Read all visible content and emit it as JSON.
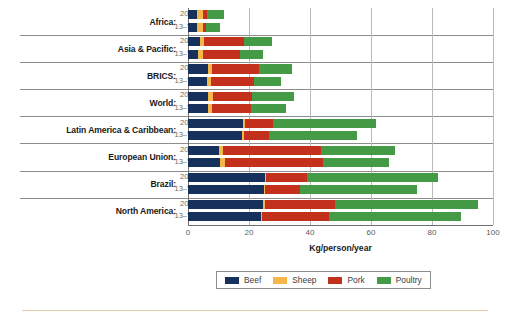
{
  "chart_data": {
    "type": "bar",
    "orientation": "horizontal",
    "stacked": true,
    "title": "",
    "xlabel": "Kg/person/year",
    "ylabel": "",
    "xlim": [
      0,
      100
    ],
    "xticks": [
      0,
      20,
      40,
      60,
      80,
      100
    ],
    "grid": true,
    "legend_position": "bottom",
    "series": [
      {
        "name": "Beef",
        "color": "#15315c"
      },
      {
        "name": "Sheep",
        "color": "#f5b64a"
      },
      {
        "name": "Pork",
        "color": "#c3301c"
      },
      {
        "name": "Poultry",
        "color": "#459b45"
      }
    ],
    "period_labels": {
      "recent": "2025",
      "base": "'13–'15"
    },
    "groups": [
      {
        "region": "Africa:",
        "bars": [
          {
            "period": "2025",
            "values": {
              "Beef": 3.0,
              "Sheep": 2.0,
              "Pork": 1.2,
              "Poultry": 5.6
            },
            "total": 11.8
          },
          {
            "period": "'13–'15",
            "values": {
              "Beef": 2.8,
              "Sheep": 2.0,
              "Pork": 1.1,
              "Poultry": 4.6
            },
            "total": 10.5
          }
        ]
      },
      {
        "region": "Asia & Pacific:",
        "bars": [
          {
            "period": "2025",
            "values": {
              "Beef": 3.8,
              "Sheep": 1.6,
              "Pork": 13.0,
              "Poultry": 9.2
            },
            "total": 27.6
          },
          {
            "period": "'13–'15",
            "values": {
              "Beef": 3.4,
              "Sheep": 1.4,
              "Pork": 12.4,
              "Poultry": 7.4
            },
            "total": 24.6
          }
        ]
      },
      {
        "region": "BRICS:",
        "bars": [
          {
            "period": "2025",
            "values": {
              "Beef": 6.4,
              "Sheep": 1.6,
              "Pork": 15.4,
              "Poultry": 10.6
            },
            "total": 34.0
          },
          {
            "period": "'13–'15",
            "values": {
              "Beef": 6.2,
              "Sheep": 1.4,
              "Pork": 14.2,
              "Poultry": 8.6
            },
            "total": 30.4
          }
        ]
      },
      {
        "region": "World:",
        "bars": [
          {
            "period": "2025",
            "values": {
              "Beef": 6.4,
              "Sheep": 1.8,
              "Pork": 12.8,
              "Poultry": 13.6
            },
            "total": 34.6
          },
          {
            "period": "'13–'15",
            "values": {
              "Beef": 6.4,
              "Sheep": 1.6,
              "Pork": 12.6,
              "Poultry": 11.4
            },
            "total": 32.0
          }
        ]
      },
      {
        "region": "Latin America & Caribbean:",
        "bars": [
          {
            "period": "2025",
            "values": {
              "Beef": 18.0,
              "Sheep": 0.6,
              "Pork": 9.4,
              "Poultry": 33.6
            },
            "total": 61.6
          },
          {
            "period": "'13–'15",
            "values": {
              "Beef": 17.6,
              "Sheep": 0.6,
              "Pork": 8.4,
              "Poultry": 28.8
            },
            "total": 55.4
          }
        ]
      },
      {
        "region": "European Union:",
        "bars": [
          {
            "period": "2025",
            "values": {
              "Beef": 10.2,
              "Sheep": 1.4,
              "Pork": 32.0,
              "Poultry": 24.4
            },
            "total": 68.0
          },
          {
            "period": "'13–'15",
            "values": {
              "Beef": 10.6,
              "Sheep": 1.4,
              "Pork": 32.2,
              "Poultry": 21.6
            },
            "total": 65.8
          }
        ]
      },
      {
        "region": "Brazil:",
        "bars": [
          {
            "period": "2025",
            "values": {
              "Beef": 25.2,
              "Sheep": 0.4,
              "Pork": 13.4,
              "Poultry": 43.0
            },
            "total": 82.0
          },
          {
            "period": "'13–'15",
            "values": {
              "Beef": 25.0,
              "Sheep": 0.4,
              "Pork": 11.4,
              "Poultry": 38.2
            },
            "total": 75.0
          }
        ]
      },
      {
        "region": "North America:",
        "bars": [
          {
            "period": "2025",
            "values": {
              "Beef": 24.6,
              "Sheep": 0.5,
              "Pork": 23.0,
              "Poultry": 47.1
            },
            "total": 95.2
          },
          {
            "period": "'13–'15",
            "values": {
              "Beef": 23.8,
              "Sheep": 0.5,
              "Pork": 22.0,
              "Poultry": 43.3
            },
            "total": 89.6
          }
        ]
      }
    ]
  },
  "legend": {
    "items": [
      {
        "label": "Beef",
        "color": "#15315c"
      },
      {
        "label": "Sheep",
        "color": "#f5b64a"
      },
      {
        "label": "Pork",
        "color": "#c3301c"
      },
      {
        "label": "Poultry",
        "color": "#459b45"
      }
    ]
  },
  "axis": {
    "x_title": "Kg/person/year",
    "x_tick_labels": [
      "0",
      "20",
      "40",
      "60",
      "80",
      "100"
    ]
  }
}
